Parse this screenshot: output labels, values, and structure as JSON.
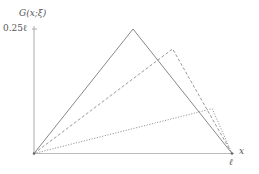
{
  "diagram": {
    "y_label": "G(x;ξ)",
    "y_tick_label": "0.25ℓ",
    "x_label": "x",
    "x_end_label": "ℓ",
    "axis_color": "#aaaaaa",
    "curve_color": "#888888",
    "curves": [
      {
        "name": "xi-0.5",
        "style": "solid",
        "xi": 0.5,
        "peak": 0.25
      },
      {
        "name": "xi-0.7",
        "style": "dashed",
        "xi": 0.7,
        "peak": 0.21
      },
      {
        "name": "xi-0.9",
        "style": "dotted",
        "xi": 0.9,
        "peak": 0.09
      }
    ]
  }
}
